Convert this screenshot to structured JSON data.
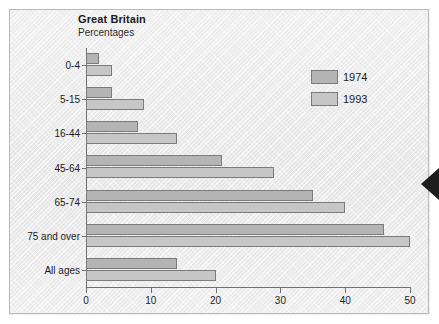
{
  "titles": {
    "main": "Great Britain",
    "sub": "Percentages"
  },
  "legend": {
    "items": [
      {
        "label": "1974",
        "color": "#b4b4b4",
        "key": "y1974"
      },
      {
        "label": "1993",
        "color": "#c6c6c6",
        "key": "y1993"
      }
    ]
  },
  "axis": {
    "x_ticks": [
      "0",
      "10",
      "20",
      "30",
      "40",
      "50"
    ]
  },
  "marker": {
    "name": "edge-arrow-left"
  },
  "chart_data": {
    "type": "bar",
    "orientation": "horizontal",
    "title": "Great Britain",
    "subtitle": "Percentages",
    "xlabel": "",
    "ylabel": "",
    "xlim": [
      0,
      50
    ],
    "xticks": [
      0,
      10,
      20,
      30,
      40,
      50
    ],
    "grid": false,
    "legend_position": "top-right",
    "categories": [
      "0-4",
      "5-15",
      "16-44",
      "45-64",
      "65-74",
      "75 and over",
      "All ages"
    ],
    "series": [
      {
        "name": "1974",
        "color": "#b4b4b4",
        "values": [
          2,
          4,
          8,
          21,
          35,
          46,
          14
        ]
      },
      {
        "name": "1993",
        "color": "#c6c6c6",
        "values": [
          4,
          9,
          14,
          29,
          40,
          50,
          20
        ]
      }
    ]
  }
}
